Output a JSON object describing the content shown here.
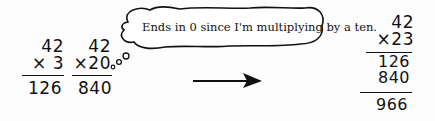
{
  "problem1": {
    "top": "42",
    "multiplier": "× 3",
    "product": "126"
  },
  "problem2": {
    "top": "42",
    "multiplier": "×20",
    "product": "840"
  },
  "thought_bubble": {
    "text": "Ends in 0 since I'm multiplying by a ten."
  },
  "arrow": {
    "direction": "right"
  },
  "result": {
    "top": "42",
    "multiplier": "×23",
    "partial1": "126",
    "partial2": "840",
    "sum": "966"
  }
}
